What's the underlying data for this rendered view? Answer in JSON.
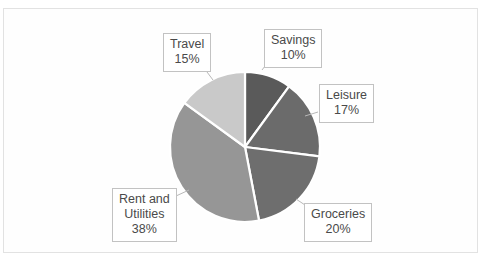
{
  "chart_data": {
    "type": "pie",
    "title": "",
    "categories": [
      "Savings",
      "Leisure",
      "Groceries",
      "Rent and Utilities",
      "Travel"
    ],
    "values": [
      10,
      17,
      20,
      38,
      15
    ],
    "value_unit": "%",
    "legend": "none",
    "labels_position": "callout-boxes",
    "slice_colors": [
      "#5a5a5a",
      "#6b6b6b",
      "#6e6e6e",
      "#969696",
      "#c9c9c9"
    ],
    "start_angle_deg": 0,
    "direction": "clockwise",
    "separator_color": "#ffffff"
  },
  "slices": [
    {
      "name": "Savings",
      "label": "Savings",
      "label_line2": "",
      "percent": "10%",
      "color": "#5a5a5a"
    },
    {
      "name": "Leisure",
      "label": "Leisure",
      "label_line2": "",
      "percent": "17%",
      "color": "#6b6b6b"
    },
    {
      "name": "Groceries",
      "label": "Groceries",
      "label_line2": "",
      "percent": "20%",
      "color": "#6e6e6e"
    },
    {
      "name": "Rent and Utilities",
      "label": "Rent and",
      "label_line2": "Utilities",
      "percent": "38%",
      "color": "#969696"
    },
    {
      "name": "Travel",
      "label": "Travel",
      "label_line2": "",
      "percent": "15%",
      "color": "#c9c9c9"
    }
  ],
  "canvas": {
    "background": "#ffffff",
    "frame_color": "#e2e2e2"
  }
}
